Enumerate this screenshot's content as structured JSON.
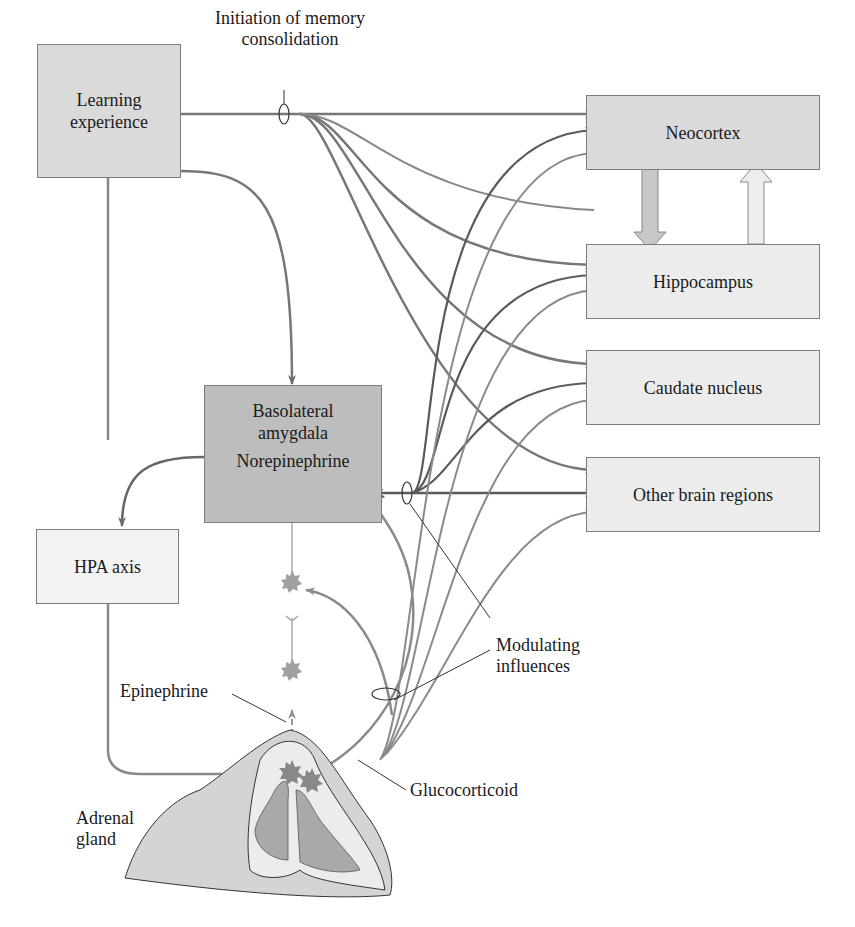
{
  "diagram": {
    "title_annotation": {
      "line1": "Initiation of memory",
      "line2": "consolidation"
    },
    "nodes": {
      "learning": {
        "line1": "Learning",
        "line2": "experience"
      },
      "neocortex": {
        "label": "Neocortex"
      },
      "hippocampus": {
        "label": "Hippocampus"
      },
      "caudate": {
        "label": "Caudate nucleus"
      },
      "other": {
        "label": "Other brain regions"
      },
      "amygdala": {
        "line1": "Basolateral",
        "line2": "amygdala",
        "line3": "Norepinephrine"
      },
      "hpa": {
        "label": "HPA axis"
      }
    },
    "annotations": {
      "modulating": {
        "line1": "Modulating",
        "line2": "influences"
      },
      "epinephrine": "Epinephrine",
      "glucocorticoid": "Glucocorticoid",
      "adrenal": {
        "line1": "Adrenal",
        "line2": "gland"
      }
    },
    "colors": {
      "line_dark": "#5a5a5a",
      "line_mid": "#777777",
      "line_light": "#9a9a9a",
      "box_border": "#7d7d7d",
      "box_mid": "#dadada",
      "box_dark": "#bdbdbd",
      "star_dark": "#555555",
      "star_light": "#a0a0a0"
    }
  }
}
